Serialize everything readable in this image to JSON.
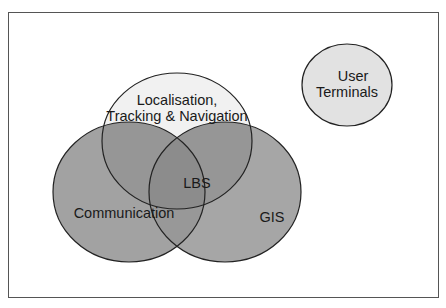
{
  "diagram": {
    "type": "venn",
    "frame": {
      "stroke": "#555555"
    },
    "sets": [
      {
        "id": "localisation",
        "label_lines": [
          "Localisation,",
          "Tracking & Navigation"
        ],
        "fill": "#f1f1f1"
      },
      {
        "id": "communication",
        "label_lines": [
          "Communication"
        ],
        "fill": "#9e9e9e"
      },
      {
        "id": "gis",
        "label_lines": [
          "GIS"
        ],
        "fill": "#a6a6a6"
      },
      {
        "id": "user_terminals",
        "label_lines": [
          "User",
          "Terminals"
        ],
        "fill": "#e2e2e2"
      }
    ],
    "intersection": {
      "label": "LBS",
      "fill": "#8c8c8c"
    },
    "colors": {
      "outline": "#222222",
      "background": "#ffffff",
      "overlap": "#8f8f8f"
    }
  }
}
